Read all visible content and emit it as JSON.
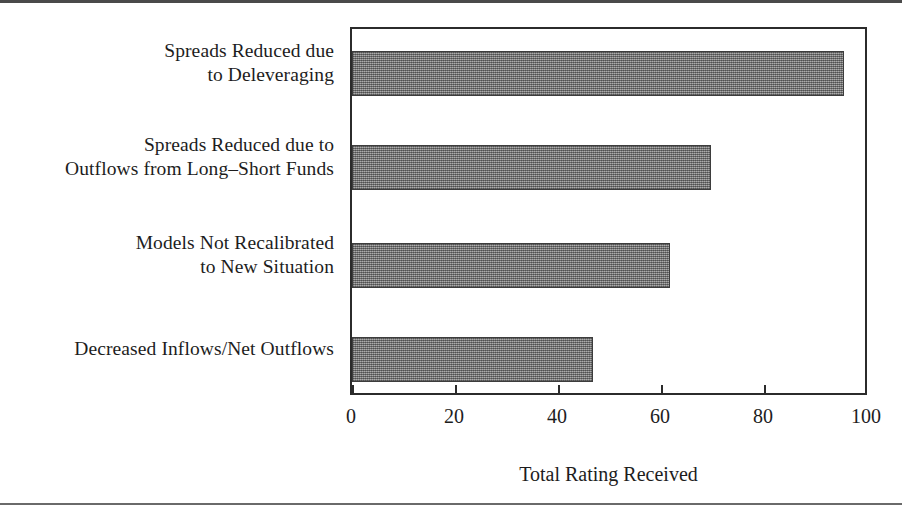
{
  "chart_data": {
    "type": "bar",
    "orientation": "horizontal",
    "title": "",
    "xlabel": "Total Rating Received",
    "ylabel": "",
    "categories": [
      "Spreads Reduced due\nto Deleveraging",
      "Spreads Reduced due to\nOutflows from Long–Short Funds",
      "Models Not Recalibrated\nto New Situation",
      "Decreased Inflows/Net Outflows"
    ],
    "values": [
      96,
      70,
      62,
      47
    ],
    "xlim": [
      0,
      100
    ],
    "xticks": [
      0,
      20,
      40,
      60,
      80,
      100
    ],
    "xtick_labels": [
      "0",
      "20",
      "40",
      "60",
      "80",
      "100"
    ],
    "grid": false,
    "legend": null,
    "bar_color": "#8a8a8a",
    "bar_edge_color": "#3d3d3d",
    "frame_color": "#2b2b2b",
    "background": "#ffffff"
  },
  "axis": {
    "x_title": "Total Rating Received",
    "tick_labels": [
      "0",
      "20",
      "40",
      "60",
      "80",
      "100"
    ]
  },
  "categories": [
    {
      "line1": "Spreads Reduced due",
      "line2": "to Deleveraging"
    },
    {
      "line1": "Spreads Reduced due to",
      "line2": "Outflows from Long–Short Funds"
    },
    {
      "line1": "Models Not Recalibrated",
      "line2": "to New Situation"
    },
    {
      "line1": "Decreased Inflows/Net Outflows",
      "line2": ""
    }
  ]
}
